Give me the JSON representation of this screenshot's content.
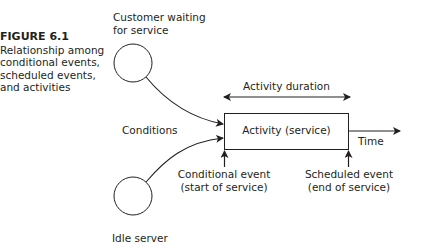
{
  "figure": {
    "number": "FIGURE 6.1",
    "caption": "Relationship among conditional events, scheduled events, and activities"
  },
  "nodes": {
    "customer": {
      "label_line1": "Customer waiting",
      "label_line2": "for service"
    },
    "server": {
      "label": "Idle server"
    },
    "activity": {
      "label": "Activity (service)"
    }
  },
  "labels": {
    "conditions": "Conditions",
    "activity_duration": "Activity duration",
    "time": "Time",
    "conditional_event_line1": "Conditional event",
    "conditional_event_line2": "(start of service)",
    "scheduled_event_line1": "Scheduled event",
    "scheduled_event_line2": "(end of service)"
  },
  "colors": {
    "stroke": "#231f20",
    "background": "#ffffff"
  }
}
